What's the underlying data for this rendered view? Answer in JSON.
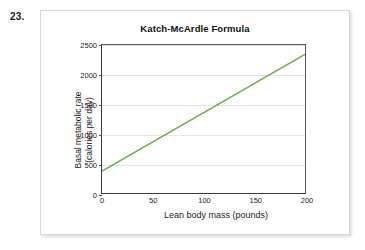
{
  "problem": {
    "number": "23."
  },
  "figure": {
    "title": "Katch-McArdle Formula"
  },
  "colors": {
    "line": "#6aa84f",
    "grid": "#e4e4e4",
    "axis": "#555555",
    "card_border": "#d8d8d8",
    "text": "#1a1a1a"
  },
  "axes": {
    "y_title_line1": "Basal metabolic rate",
    "y_title_line2": "(calories per day)",
    "x_title": "Lean body mass (pounds)",
    "y_ticks": [
      "0",
      "500",
      "1000",
      "1500",
      "2000",
      "2500"
    ],
    "x_ticks": [
      "0",
      "50",
      "100",
      "150",
      "200"
    ]
  },
  "chart_data": {
    "type": "line",
    "title": "Katch-McArdle Formula",
    "xlabel": "Lean body mass (pounds)",
    "ylabel": "Basal metabolic rate (calories per day)",
    "xlim": [
      0,
      200
    ],
    "ylim": [
      0,
      2500
    ],
    "xticks": [
      0,
      50,
      100,
      150,
      200
    ],
    "yticks": [
      0,
      500,
      1000,
      1500,
      2000,
      2500
    ],
    "grid": "horizontal",
    "legend": "none",
    "series": [
      {
        "name": "Basal metabolic rate",
        "color": "#6aa84f",
        "x": [
          0,
          200
        ],
        "y": [
          370,
          2340
        ]
      }
    ]
  }
}
